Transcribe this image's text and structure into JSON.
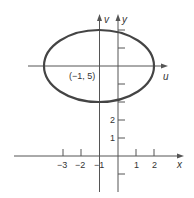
{
  "figure": {
    "type": "ellipse-with-translated-axes",
    "colors": {
      "ellipse": "#444444",
      "axes": "#555555",
      "text": "#333333"
    },
    "ellipse": {
      "center_label": "(−1, 5)",
      "center_xy": [
        -1,
        5
      ]
    },
    "axes": {
      "x_label": "x",
      "y_label": "y",
      "u_label": "u",
      "v_label": "v"
    },
    "x_ticks": [
      {
        "value": -3,
        "label": "−3"
      },
      {
        "value": -2,
        "label": "−2"
      },
      {
        "value": -1,
        "label": "−1"
      },
      {
        "value": 1,
        "label": "1"
      },
      {
        "value": 2,
        "label": "2"
      }
    ],
    "y_ticks": [
      {
        "value": 1,
        "label": "1"
      },
      {
        "value": 2,
        "label": "2"
      }
    ]
  }
}
